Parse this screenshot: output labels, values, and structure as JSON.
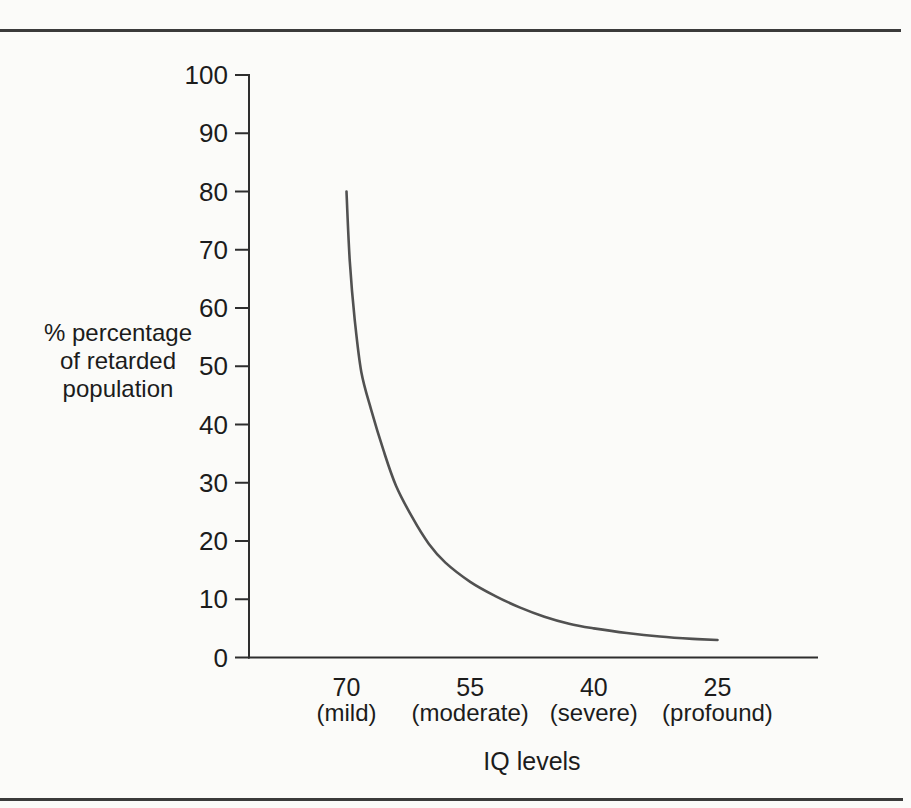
{
  "figure": {
    "background": "#fbfbf9",
    "rule_color": "#3b3b3b"
  },
  "chart_data": {
    "type": "line",
    "title": "",
    "xlabel": "IQ levels",
    "ylabel": "% percentage\nof retarded\npopulation",
    "ylim": [
      0,
      100
    ],
    "y_ticks": [
      100,
      90,
      80,
      70,
      60,
      50,
      40,
      30,
      20,
      10,
      0
    ],
    "x_ticks": [
      {
        "value": 70,
        "label": "70",
        "sublabel": "(mild)"
      },
      {
        "value": 55,
        "label": "55",
        "sublabel": "(moderate)"
      },
      {
        "value": 40,
        "label": "40",
        "sublabel": "(severe)"
      },
      {
        "value": 25,
        "label": "25",
        "sublabel": "(profound)"
      }
    ],
    "x_axis_note": "IQ decreases from left (70) to right (25); no x tick marks drawn, labels only",
    "grid": false,
    "legend": false,
    "series": [
      {
        "name": "% of retarded population vs IQ level",
        "points": [
          [
            70,
            80
          ],
          [
            69.6,
            68
          ],
          [
            69,
            58
          ],
          [
            68.2,
            49
          ],
          [
            67,
            42.5
          ],
          [
            65.5,
            35.5
          ],
          [
            64,
            29.5
          ],
          [
            62,
            24
          ],
          [
            60,
            19.5
          ],
          [
            58,
            16.3
          ],
          [
            55,
            13
          ],
          [
            52,
            10.6
          ],
          [
            49,
            8.6
          ],
          [
            46,
            7
          ],
          [
            43,
            5.8
          ],
          [
            40,
            5
          ],
          [
            36,
            4.2
          ],
          [
            32,
            3.6
          ],
          [
            28,
            3.2
          ],
          [
            25,
            3
          ]
        ]
      }
    ],
    "colors": {
      "line": "#515151",
      "axis": "#2e2e2e",
      "text": "#1c1c1c"
    }
  }
}
